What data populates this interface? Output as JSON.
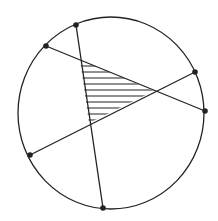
{
  "diagram": {
    "type": "geometry",
    "colors": {
      "stroke": "#222222",
      "background": "#ffffff"
    },
    "circle": {
      "cx": 111,
      "cy": 113,
      "rx": 93,
      "ry": 96
    },
    "points": [
      {
        "id": "P1",
        "x": 76,
        "y": 25
      },
      {
        "id": "P2",
        "x": 46,
        "y": 46
      },
      {
        "id": "P3",
        "x": 195,
        "y": 72
      },
      {
        "id": "P4",
        "x": 205,
        "y": 111
      },
      {
        "id": "P5",
        "x": 30,
        "y": 155
      },
      {
        "id": "P6",
        "x": 103,
        "y": 208
      }
    ],
    "chords": [
      {
        "from": "P1",
        "to": "P6"
      },
      {
        "from": "P2",
        "to": "P4"
      },
      {
        "from": "P5",
        "to": "P3"
      }
    ],
    "shaded_triangle": {
      "vertices": [
        {
          "x": 80,
          "y": 60
        },
        {
          "x": 154,
          "y": 91
        },
        {
          "x": 89,
          "y": 123
        }
      ],
      "fill": "horizontal-hatch",
      "hatch_lines": 10
    }
  }
}
